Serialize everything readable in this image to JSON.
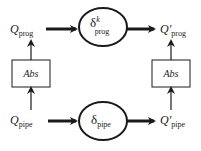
{
  "diagram": {
    "type": "commutative-diagram",
    "colors": {
      "ink": "#1a1a1a",
      "background": "#ffffff"
    },
    "top_row": {
      "input": {
        "symbol": "Q",
        "prime": "",
        "subscript": "prog"
      },
      "process": {
        "symbol": "δ",
        "superscript": "k",
        "subscript": "prog"
      },
      "output": {
        "symbol": "Q",
        "prime": "′",
        "subscript": "prog"
      }
    },
    "bottom_row": {
      "input": {
        "symbol": "Q",
        "prime": "",
        "subscript": "pipe"
      },
      "process": {
        "symbol": "δ",
        "superscript": "",
        "subscript": "pipe"
      },
      "output": {
        "symbol": "Q",
        "prime": "′",
        "subscript": "pipe"
      }
    },
    "left_abstraction": {
      "label": "Abs"
    },
    "right_abstraction": {
      "label": "Abs"
    },
    "edges": [
      {
        "from": "Q_pipe",
        "to": "Abs (left)",
        "style": "arrow"
      },
      {
        "from": "Abs (left)",
        "to": "Q_prog",
        "style": "arrow"
      },
      {
        "from": "Q_prog",
        "to": "δ^k_prog",
        "style": "thick-arrow"
      },
      {
        "from": "δ^k_prog",
        "to": "Q′_prog",
        "style": "thick-arrow"
      },
      {
        "from": "Q_pipe",
        "to": "δ_pipe",
        "style": "thick-arrow"
      },
      {
        "from": "δ_pipe",
        "to": "Q′_pipe",
        "style": "thick-arrow"
      },
      {
        "from": "Q′_pipe",
        "to": "Abs (right)",
        "style": "arrow"
      },
      {
        "from": "Abs (right)",
        "to": "Q′_prog",
        "style": "arrow"
      }
    ]
  }
}
